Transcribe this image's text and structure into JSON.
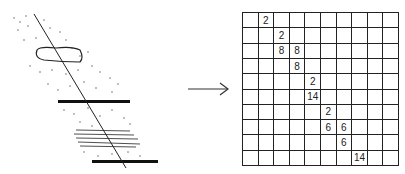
{
  "figure": {
    "left_panel": "sketch of inclined borehole line crossing stippled sediment with lens body, two dark horizontal beds and laminated zone",
    "arrow": "right-arrow",
    "grid": {
      "rows": 10,
      "cols": 10,
      "cells": [
        {
          "row": 0,
          "col": 1,
          "value": "2"
        },
        {
          "row": 1,
          "col": 2,
          "value": "2"
        },
        {
          "row": 2,
          "col": 2,
          "value": "8"
        },
        {
          "row": 2,
          "col": 3,
          "value": "8"
        },
        {
          "row": 3,
          "col": 3,
          "value": "8"
        },
        {
          "row": 4,
          "col": 4,
          "value": "2"
        },
        {
          "row": 5,
          "col": 4,
          "value": "14"
        },
        {
          "row": 6,
          "col": 5,
          "value": "2"
        },
        {
          "row": 7,
          "col": 5,
          "value": "6"
        },
        {
          "row": 7,
          "col": 6,
          "value": "6"
        },
        {
          "row": 8,
          "col": 6,
          "value": "6"
        },
        {
          "row": 9,
          "col": 7,
          "value": "14"
        }
      ]
    }
  }
}
